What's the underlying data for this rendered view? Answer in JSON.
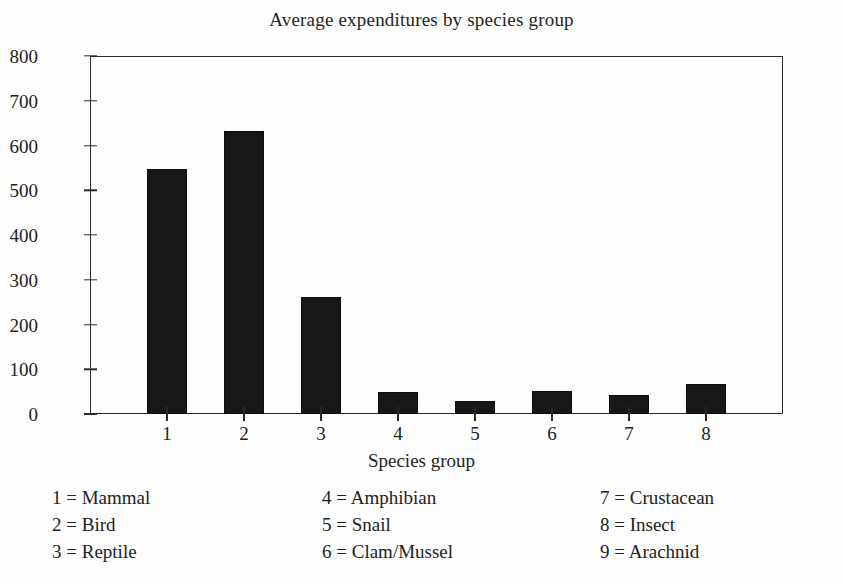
{
  "chart_data": {
    "type": "bar",
    "title": "Average expenditures by species group",
    "xlabel": "Species group",
    "ylabel": "",
    "categories": [
      "1",
      "2",
      "3",
      "4",
      "5",
      "6",
      "7",
      "8"
    ],
    "values": [
      547,
      633,
      262,
      49,
      28,
      51,
      43,
      68
    ],
    "ylim": [
      0,
      800
    ],
    "yticks": [
      0,
      100,
      200,
      300,
      400,
      500,
      600,
      700,
      800
    ],
    "ytick_labels": [
      "0",
      "100",
      "200",
      "300",
      "400",
      "500",
      "600",
      "700",
      "800"
    ],
    "xtick_labels": [
      "1",
      "2",
      "3",
      "4",
      "5",
      "6",
      "7",
      "8"
    ],
    "grid": false,
    "legend_position": "below-plot",
    "bar_color": "#171717",
    "axis_color": "#2b2b2b",
    "background_color": "#fefefe",
    "legend": [
      {
        "key": "1",
        "label": "Mammal"
      },
      {
        "key": "2",
        "label": "Bird"
      },
      {
        "key": "3",
        "label": "Reptile"
      },
      {
        "key": "4",
        "label": "Amphibian"
      },
      {
        "key": "5",
        "label": "Snail"
      },
      {
        "key": "6",
        "label": "Clam/Mussel"
      },
      {
        "key": "7",
        "label": "Crustacean"
      },
      {
        "key": "8",
        "label": "Insect"
      },
      {
        "key": "9",
        "label": "Arachnid"
      }
    ]
  },
  "legend_columns": [
    {
      "entries": [
        "1 = Mammal",
        "2 = Bird",
        "3 = Reptile"
      ]
    },
    {
      "entries": [
        "4 = Amphibian",
        "5 = Snail",
        "6 = Clam/Mussel"
      ]
    },
    {
      "entries": [
        "7 = Crustacean",
        "8 = Insect",
        "9 = Arachnid"
      ]
    }
  ]
}
